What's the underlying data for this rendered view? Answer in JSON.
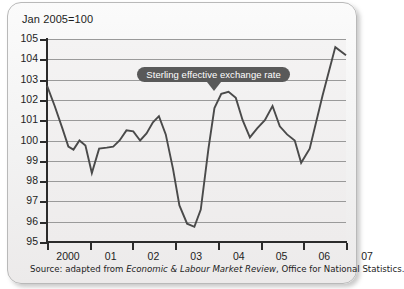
{
  "figure": {
    "title": "Jan 2005=100",
    "source_prefix": "Source: adapted from ",
    "source_italic": "Economic & Labour Market Review",
    "source_suffix": ", Office for National Statistics.",
    "source_full": "Source: adapted from Economic & Labour Market Review, Office for National Statistics."
  },
  "callout": {
    "label": "Sterling effective exchange rate",
    "background_color": "#595959",
    "text_color": "#ffffff"
  },
  "colors": {
    "line": "#4a4a4a",
    "gridline": "#9a9a9a",
    "axis": "#2b2b2b",
    "plot_background": "#f0efef",
    "panel_background": "#f4f3f3",
    "panel_border": "#b9b9b9"
  },
  "chart_data": {
    "type": "line",
    "title": "Jan 2005=100",
    "xlabel": "",
    "ylabel": "",
    "ylim": [
      95,
      105
    ],
    "ytick_step": 1,
    "yticks": [
      105,
      104,
      103,
      102,
      101,
      100,
      99,
      98,
      97,
      96,
      95
    ],
    "xlim": [
      2000,
      2007
    ],
    "xticks": [
      2000,
      2001,
      2002,
      2003,
      2004,
      2005,
      2006,
      2007
    ],
    "xtick_labels": [
      "2000",
      "01",
      "02",
      "03",
      "04",
      "05",
      "06",
      "07"
    ],
    "grid": true,
    "legend": "none",
    "annotations": [
      {
        "text": "Sterling effective exchange rate",
        "points_to_x": 2003.9,
        "points_to_y": 102.4
      }
    ],
    "series": [
      {
        "name": "Sterling effective exchange rate",
        "color": "#4a4a4a",
        "x": [
          2000.0,
          2000.18,
          2000.36,
          2000.5,
          2000.62,
          2000.76,
          2000.9,
          2001.05,
          2001.22,
          2001.4,
          2001.55,
          2001.7,
          2001.86,
          2002.02,
          2002.18,
          2002.33,
          2002.48,
          2002.62,
          2002.78,
          2002.95,
          2003.1,
          2003.28,
          2003.45,
          2003.6,
          2003.78,
          2003.92,
          2004.08,
          2004.25,
          2004.42,
          2004.58,
          2004.75,
          2004.92,
          2005.1,
          2005.28,
          2005.45,
          2005.62,
          2005.8,
          2005.95,
          2006.15,
          2006.45,
          2006.75,
          2007.0
        ],
        "y": [
          102.7,
          101.7,
          100.6,
          99.7,
          99.55,
          100.0,
          99.75,
          98.4,
          99.6,
          99.65,
          99.7,
          100.0,
          100.5,
          100.45,
          100.0,
          100.35,
          100.9,
          101.2,
          100.3,
          98.6,
          96.8,
          95.9,
          95.75,
          96.6,
          99.6,
          101.6,
          102.3,
          102.4,
          102.1,
          101.0,
          100.15,
          100.6,
          101.0,
          101.7,
          100.7,
          100.3,
          100.0,
          98.9,
          99.6,
          102.2,
          104.6,
          104.2
        ]
      }
    ]
  }
}
